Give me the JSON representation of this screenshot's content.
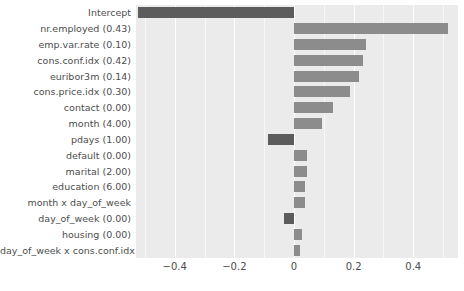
{
  "chart_data": {
    "type": "bar",
    "orientation": "horizontal",
    "title": "",
    "xlabel": "",
    "ylabel": "",
    "xlim": [
      -0.53,
      0.55
    ],
    "xticks": [
      -0.4,
      -0.2,
      0,
      0.2,
      0.4
    ],
    "xticklabels": [
      "−0.4",
      "−0.2",
      "0",
      "0.2",
      "0.4"
    ],
    "grid": true,
    "legend": null,
    "categories": [
      "Intercept",
      "nr.employed (0.43)",
      "emp.var.rate (0.10)",
      "cons.conf.idx (0.42)",
      "euribor3m (0.14)",
      "cons.price.idx (0.30)",
      "contact (0.00)",
      "month (4.00)",
      "pdays (1.00)",
      "default (0.00)",
      "marital (2.00)",
      "education (6.00)",
      "month x day_of_week",
      "day_of_week (0.00)",
      "housing (0.00)",
      "day_of_week x cons.conf.idx"
    ],
    "values": [
      -0.523,
      0.517,
      0.24,
      0.233,
      0.217,
      0.187,
      0.13,
      0.093,
      -0.087,
      0.043,
      0.043,
      0.037,
      0.037,
      -0.033,
      0.027,
      0.02
    ],
    "colors": {
      "positive": "#8c8c8c",
      "negative": "#5c5c5c",
      "panel_background": "#ebebeb",
      "gridline": "#ffffff",
      "text": "#4d4d4d"
    }
  }
}
